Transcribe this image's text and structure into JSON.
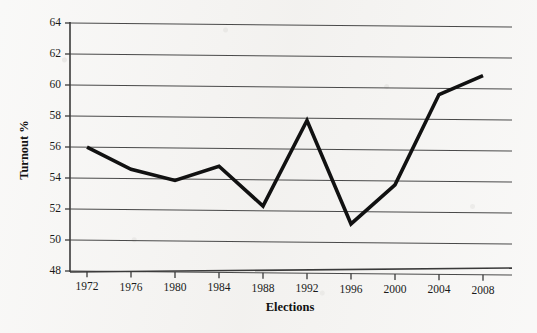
{
  "chart_data": {
    "type": "line",
    "title": "",
    "subtitle": "",
    "xlabel": "Elections",
    "ylabel": "Turnout %",
    "categories": [
      "1972",
      "1976",
      "1980",
      "1984",
      "1988",
      "1992",
      "1996",
      "2000",
      "2004",
      "2008"
    ],
    "x": [
      1972,
      1976,
      1980,
      1984,
      1988,
      1992,
      1996,
      2000,
      2004,
      2008
    ],
    "values": [
      56.0,
      54.6,
      53.9,
      54.85,
      52.3,
      57.85,
      51.2,
      53.75,
      59.6,
      60.85
    ],
    "series": [
      {
        "name": "Turnout %",
        "values": [
          56.0,
          54.6,
          53.9,
          54.85,
          52.3,
          57.85,
          51.2,
          53.75,
          59.6,
          60.85
        ]
      }
    ],
    "ylim": [
      48,
      64
    ],
    "xlim": [
      1972,
      2008
    ],
    "ytick_labels": [
      "48",
      "50",
      "52",
      "54",
      "56",
      "58",
      "60",
      "62",
      "64"
    ],
    "yticks": [
      48,
      50,
      52,
      54,
      56,
      58,
      60,
      62,
      64
    ],
    "xtick_labels": [
      "1972",
      "1976",
      "1980",
      "1984",
      "1988",
      "1992",
      "1996",
      "2000",
      "2004",
      "2008"
    ],
    "grid": "horizontal",
    "legend": "none",
    "line_color": "#111111",
    "grid_color": "#4a4a4a",
    "background_color": "#f4f3f1",
    "markers": "none",
    "annotations": []
  }
}
